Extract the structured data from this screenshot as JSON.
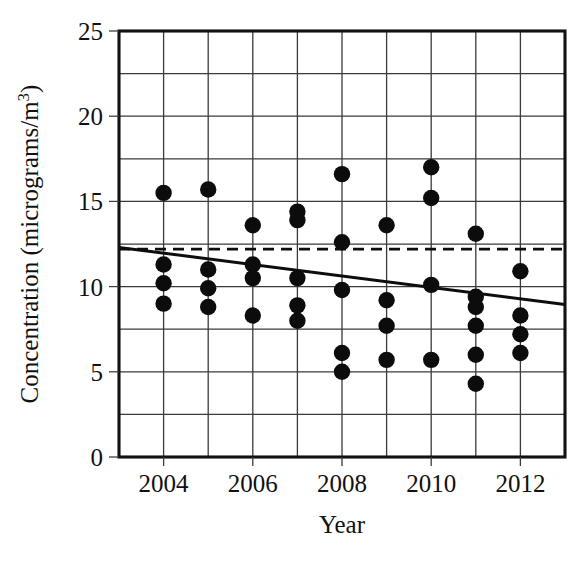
{
  "chart_data": {
    "type": "scatter",
    "title": "",
    "xlabel": "Year",
    "ylabel": "Concentration (micrograms/m",
    "ylabel_sup": "3",
    "ylabel_tail": ")",
    "xlim": [
      2003,
      2013
    ],
    "ylim": [
      0,
      25
    ],
    "x_ticks": [
      2004,
      2006,
      2008,
      2010,
      2012
    ],
    "x_tick_labels": [
      "2004",
      "2006",
      "2008",
      "2010",
      "2012"
    ],
    "x_gridlines": [
      2004,
      2005,
      2006,
      2007,
      2008,
      2009,
      2010,
      2011,
      2012
    ],
    "y_ticks": [
      0,
      5,
      10,
      15,
      20,
      25
    ],
    "y_tick_labels": [
      "0",
      "5",
      "10",
      "15",
      "20",
      "25"
    ],
    "y_gridlines": [
      2.5,
      5,
      7.5,
      10,
      12.5,
      15,
      17.5,
      20,
      22.5
    ],
    "grid": true,
    "legend": "none",
    "points": [
      {
        "x": 2004,
        "y": 15.5
      },
      {
        "x": 2004,
        "y": 11.3
      },
      {
        "x": 2004,
        "y": 10.2
      },
      {
        "x": 2004,
        "y": 9.0
      },
      {
        "x": 2005,
        "y": 15.7
      },
      {
        "x": 2005,
        "y": 11.0
      },
      {
        "x": 2005,
        "y": 9.9
      },
      {
        "x": 2005,
        "y": 8.8
      },
      {
        "x": 2006,
        "y": 13.6
      },
      {
        "x": 2006,
        "y": 11.3
      },
      {
        "x": 2006,
        "y": 10.5
      },
      {
        "x": 2006,
        "y": 8.3
      },
      {
        "x": 2007,
        "y": 14.4
      },
      {
        "x": 2007,
        "y": 13.9
      },
      {
        "x": 2007,
        "y": 10.5
      },
      {
        "x": 2007,
        "y": 8.9
      },
      {
        "x": 2007,
        "y": 8.0
      },
      {
        "x": 2008,
        "y": 16.6
      },
      {
        "x": 2008,
        "y": 12.6
      },
      {
        "x": 2008,
        "y": 9.8
      },
      {
        "x": 2008,
        "y": 6.1
      },
      {
        "x": 2008,
        "y": 5.0
      },
      {
        "x": 2009,
        "y": 13.6
      },
      {
        "x": 2009,
        "y": 9.2
      },
      {
        "x": 2009,
        "y": 7.7
      },
      {
        "x": 2009,
        "y": 5.7
      },
      {
        "x": 2010,
        "y": 17.0
      },
      {
        "x": 2010,
        "y": 15.2
      },
      {
        "x": 2010,
        "y": 10.1
      },
      {
        "x": 2010,
        "y": 5.7
      },
      {
        "x": 2011,
        "y": 13.1
      },
      {
        "x": 2011,
        "y": 9.4
      },
      {
        "x": 2011,
        "y": 8.8
      },
      {
        "x": 2011,
        "y": 7.7
      },
      {
        "x": 2011,
        "y": 6.0
      },
      {
        "x": 2011,
        "y": 4.3
      },
      {
        "x": 2012,
        "y": 10.9
      },
      {
        "x": 2012,
        "y": 8.3
      },
      {
        "x": 2012,
        "y": 7.2
      },
      {
        "x": 2012,
        "y": 6.1
      }
    ],
    "trend_line": {
      "style": "solid",
      "x_start": 2003,
      "y_start": 12.3,
      "x_end": 2013,
      "y_end": 8.95
    },
    "mean_line": {
      "style": "dashed",
      "y": 12.2,
      "x_start": 2003,
      "x_end": 2013
    }
  },
  "colors": {
    "marker": "#0c0c0c",
    "grid": "#3a3a3a",
    "axis": "#111111",
    "background": "#ffffff"
  }
}
